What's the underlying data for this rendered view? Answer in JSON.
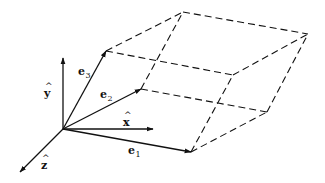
{
  "diagram": {
    "type": "parallelepiped-basis-vectors",
    "colors": {
      "stroke": "#111111",
      "background": "#ffffff"
    },
    "origin": [
      63,
      129
    ],
    "axes": [
      {
        "id": "y",
        "label": "y",
        "hat": "^",
        "tip": [
          63,
          58
        ],
        "label_pos": [
          44,
          97
        ]
      },
      {
        "id": "x",
        "label": "x",
        "hat": "^",
        "tip": [
          153,
          129
        ],
        "label_pos": [
          123,
          126
        ]
      },
      {
        "id": "z",
        "label": "z",
        "hat": "^",
        "tip": [
          20,
          172
        ],
        "label_pos": [
          41,
          169
        ]
      }
    ],
    "basis_vectors": [
      {
        "id": "e1",
        "base": "e",
        "subscript": "1",
        "tip": [
          191,
          152
        ],
        "label_pos": [
          128,
          154
        ]
      },
      {
        "id": "e2",
        "base": "e",
        "subscript": "2",
        "tip": [
          141,
          89
        ],
        "label_pos": [
          100,
          98
        ]
      },
      {
        "id": "e3",
        "base": "e",
        "subscript": "3",
        "tip": [
          106,
          51
        ],
        "label_pos": [
          78,
          75
        ]
      }
    ],
    "dashed_edges": [
      {
        "from": "e1",
        "to": "e1+e2",
        "p1": [
          191,
          152
        ],
        "p2": [
          267,
          112
        ]
      },
      {
        "from": "e1",
        "to": "e1+e3",
        "p1": [
          191,
          152
        ],
        "p2": [
          233,
          75
        ]
      },
      {
        "from": "e2",
        "to": "e1+e2",
        "p1": [
          141,
          89
        ],
        "p2": [
          267,
          112
        ]
      },
      {
        "from": "e2",
        "to": "e2+e3",
        "p1": [
          141,
          89
        ],
        "p2": [
          183,
          12
        ]
      },
      {
        "from": "e3",
        "to": "e1+e3",
        "p1": [
          106,
          51
        ],
        "p2": [
          233,
          75
        ]
      },
      {
        "from": "e3",
        "to": "e2+e3",
        "p1": [
          106,
          51
        ],
        "p2": [
          183,
          12
        ]
      },
      {
        "from": "e1+e2",
        "to": "e1+e2+e3",
        "p1": [
          267,
          112
        ],
        "p2": [
          308,
          34
        ]
      },
      {
        "from": "e1+e3",
        "to": "e1+e2+e3",
        "p1": [
          233,
          75
        ],
        "p2": [
          308,
          34
        ]
      },
      {
        "from": "e2+e3",
        "to": "e1+e2+e3",
        "p1": [
          183,
          12
        ],
        "p2": [
          308,
          34
        ]
      }
    ]
  }
}
